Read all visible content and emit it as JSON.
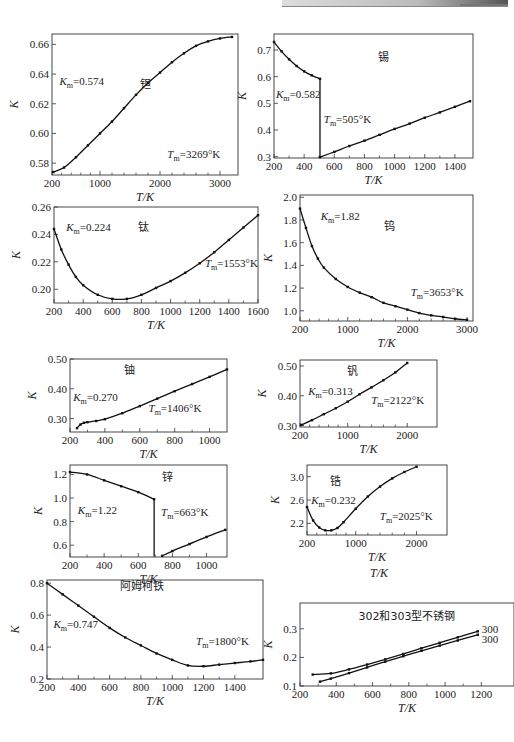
{
  "page": {
    "header_band": "running header (illegible)"
  },
  "chart_data": [
    {
      "id": "tantalum",
      "type": "line",
      "title": "钽",
      "xlabel": "T/K",
      "ylabel": "K",
      "xlim": [
        200,
        3300
      ],
      "ylim": [
        0.572,
        0.667
      ],
      "xticks": [
        200,
        1000,
        2000,
        3000
      ],
      "yticks": [
        0.58,
        0.6,
        0.62,
        0.64,
        0.66
      ],
      "ytick_labels": [
        "0.58",
        "0.60",
        "0.62",
        "0.64",
        "0.66"
      ],
      "annotations": {
        "km": "K",
        "km_sub": "m",
        "km_val": "=0.574",
        "tm": "T",
        "tm_sub": "m",
        "tm_val": "=3269°K"
      },
      "series": [
        {
          "name": "钽",
          "x": [
            220,
            400,
            600,
            800,
            1000,
            1200,
            1400,
            1600,
            1800,
            2000,
            2200,
            2400,
            2600,
            2800,
            3000,
            3200
          ],
          "y": [
            0.574,
            0.577,
            0.584,
            0.592,
            0.6,
            0.608,
            0.617,
            0.626,
            0.634,
            0.641,
            0.648,
            0.654,
            0.659,
            0.662,
            0.664,
            0.665
          ]
        }
      ]
    },
    {
      "id": "tin",
      "type": "line",
      "title": "锡",
      "xlabel": "T/K",
      "ylabel": "K",
      "xlim": [
        200,
        1520
      ],
      "ylim": [
        0.295,
        0.76
      ],
      "xticks": [
        200,
        400,
        600,
        800,
        1000,
        1200,
        1400
      ],
      "yticks": [
        0.3,
        0.4,
        0.5,
        0.6,
        0.7
      ],
      "ytick_labels": [
        "0.3",
        "0.4",
        "0.5",
        "0.6",
        "0.7"
      ],
      "annotations": {
        "km": "K",
        "km_sub": "m",
        "km_val": "=0.582",
        "tm": "T",
        "tm_sub": "m",
        "tm_val": "=505°K"
      },
      "series": [
        {
          "name": "solid",
          "x": [
            200,
            250,
            300,
            350,
            400,
            450,
            505
          ],
          "y": [
            0.73,
            0.695,
            0.665,
            0.64,
            0.62,
            0.605,
            0.592
          ]
        },
        {
          "name": "drop",
          "x": [
            505,
            505
          ],
          "y": [
            0.592,
            0.298
          ],
          "markers": false
        },
        {
          "name": "liquid",
          "x": [
            505,
            600,
            700,
            800,
            900,
            1000,
            1100,
            1200,
            1300,
            1400,
            1500
          ],
          "y": [
            0.298,
            0.318,
            0.34,
            0.36,
            0.382,
            0.404,
            0.424,
            0.446,
            0.466,
            0.487,
            0.508
          ]
        }
      ]
    },
    {
      "id": "titanium",
      "type": "line",
      "title": "钛",
      "xlabel": "T/K",
      "ylabel": "K",
      "xlim": [
        200,
        1600
      ],
      "ylim": [
        0.19,
        0.26
      ],
      "xticks": [
        200,
        400,
        600,
        800,
        1000,
        1200,
        1400,
        1600
      ],
      "yticks": [
        0.2,
        0.22,
        0.24,
        0.26
      ],
      "ytick_labels": [
        "0.20",
        "0.22",
        "0.24",
        "0.26"
      ],
      "annotations": {
        "km": "K",
        "km_sub": "m",
        "km_val": "=0.224",
        "tm": "T",
        "tm_sub": "m",
        "tm_val": "=1553°K"
      },
      "series": [
        {
          "name": "钛",
          "x": [
            200,
            250,
            300,
            350,
            400,
            500,
            600,
            700,
            800,
            900,
            1000,
            1100,
            1200,
            1300,
            1400,
            1500,
            1600
          ],
          "y": [
            0.244,
            0.229,
            0.218,
            0.209,
            0.203,
            0.196,
            0.193,
            0.193,
            0.196,
            0.201,
            0.206,
            0.212,
            0.219,
            0.227,
            0.236,
            0.245,
            0.254
          ]
        }
      ]
    },
    {
      "id": "tungsten",
      "type": "line",
      "title": "钨",
      "xlabel": "T/K",
      "ylabel": "K",
      "xlim": [
        200,
        3100
      ],
      "ylim": [
        0.91,
        2.02
      ],
      "xticks": [
        200,
        1000,
        2000,
        3000
      ],
      "yticks": [
        1.0,
        1.2,
        1.4,
        1.6,
        1.8,
        2.0
      ],
      "ytick_labels": [
        "1.0",
        "1.2",
        "1.4",
        "1.6",
        "1.8",
        "2.0"
      ],
      "annotations": {
        "km": "K",
        "km_sub": "m",
        "km_val": "=1.82",
        "tm": "T",
        "tm_sub": "m",
        "tm_val": "=3653°K"
      },
      "series": [
        {
          "name": "钨",
          "x": [
            200,
            300,
            400,
            500,
            600,
            800,
            1000,
            1200,
            1400,
            1600,
            1800,
            2000,
            2200,
            2400,
            2600,
            2800,
            3000
          ],
          "y": [
            1.9,
            1.73,
            1.57,
            1.46,
            1.38,
            1.28,
            1.21,
            1.16,
            1.12,
            1.07,
            1.04,
            1.01,
            0.98,
            0.96,
            0.945,
            0.93,
            0.92
          ]
        }
      ]
    },
    {
      "id": "uranium",
      "type": "line",
      "title": "铀",
      "xlabel": "T/K",
      "ylabel": "K",
      "xlim": [
        200,
        1100
      ],
      "ylim": [
        0.255,
        0.5
      ],
      "xticks": [
        200,
        400,
        600,
        800,
        1000
      ],
      "yticks": [
        0.3,
        0.4,
        0.5
      ],
      "ytick_labels": [
        "0.30",
        "0.40",
        "0.50"
      ],
      "annotations": {
        "km": "K",
        "km_sub": "m",
        "km_val": "=0.270",
        "tm": "T",
        "tm_sub": "m",
        "tm_val": "=1406°K"
      },
      "series": [
        {
          "name": "铀",
          "x": [
            240,
            260,
            280,
            300,
            350,
            400,
            500,
            600,
            700,
            800,
            900,
            1000,
            1100
          ],
          "y": [
            0.268,
            0.28,
            0.286,
            0.288,
            0.292,
            0.298,
            0.318,
            0.342,
            0.367,
            0.392,
            0.416,
            0.44,
            0.465
          ]
        }
      ]
    },
    {
      "id": "vanadium",
      "type": "line",
      "title": "钒",
      "xlabel": "T/K",
      "ylabel": "K",
      "xlim": [
        200,
        2500
      ],
      "ylim": [
        0.295,
        0.52
      ],
      "xticks": [
        200,
        1000,
        2000
      ],
      "yticks": [
        0.3,
        0.4,
        0.5
      ],
      "ytick_labels": [
        "0.30",
        "0.40",
        "0.50"
      ],
      "annotations": {
        "km": "K",
        "km_sub": "m",
        "km_val": "=0.313",
        "tm": "T",
        "tm_sub": "m",
        "tm_val": "=2122°K"
      },
      "series": [
        {
          "name": "钒",
          "x": [
            220,
            400,
            600,
            800,
            1000,
            1200,
            1400,
            1600,
            1800,
            2000
          ],
          "y": [
            0.302,
            0.318,
            0.338,
            0.358,
            0.38,
            0.405,
            0.428,
            0.452,
            0.478,
            0.51
          ]
        }
      ]
    },
    {
      "id": "zinc",
      "type": "line",
      "title": "锌",
      "xlabel": "T/K",
      "ylabel": "K",
      "xlim": [
        200,
        1120
      ],
      "ylim": [
        0.5,
        1.28
      ],
      "xticks": [
        200,
        400,
        600,
        800,
        1000
      ],
      "yticks": [
        0.6,
        0.8,
        1.0,
        1.2
      ],
      "ytick_labels": [
        "0.6",
        "0.8",
        "1.0",
        "1.2"
      ],
      "annotations": {
        "km": "K",
        "km_sub": "m",
        "km_val": "=1.22",
        "tm": "T",
        "tm_sub": "m",
        "tm_val": "=663°K"
      },
      "series": [
        {
          "name": "solid",
          "x": [
            200,
            300,
            400,
            500,
            600,
            693
          ],
          "y": [
            1.22,
            1.2,
            1.15,
            1.1,
            1.05,
            0.99
          ]
        },
        {
          "name": "drop",
          "x": [
            693,
            693
          ],
          "y": [
            0.99,
            0.505
          ],
          "markers": false
        },
        {
          "name": "liquid",
          "x": [
            740,
            800,
            900,
            1000,
            1110
          ],
          "y": [
            0.51,
            0.55,
            0.61,
            0.67,
            0.73
          ]
        }
      ]
    },
    {
      "id": "zirconium",
      "type": "line",
      "title": "锆",
      "xlabel": "T/K",
      "ylabel": "K",
      "xlim": [
        200,
        2500
      ],
      "ylim": [
        2.0,
        3.2
      ],
      "xticks": [
        200,
        1000,
        2000
      ],
      "yticks": [
        2.2,
        2.6,
        3.0
      ],
      "ytick_labels": [
        "2.2",
        "2.6",
        "3.0"
      ],
      "annotations": {
        "km": "K",
        "km_sub": "m",
        "km_val": "=0.232",
        "tm": "T",
        "tm_sub": "m",
        "tm_val": "=2025°K"
      },
      "series": [
        {
          "name": "锆",
          "x": [
            200,
            300,
            400,
            500,
            600,
            700,
            800,
            1000,
            1200,
            1400,
            1600,
            1800,
            2000
          ],
          "y": [
            2.48,
            2.25,
            2.13,
            2.08,
            2.08,
            2.12,
            2.22,
            2.45,
            2.66,
            2.83,
            2.97,
            3.08,
            3.17
          ]
        }
      ]
    },
    {
      "id": "armco-iron",
      "type": "line",
      "title": "阿姆柯铁",
      "xlabel": "T/K",
      "ylabel": "K",
      "xlim": [
        200,
        1580
      ],
      "ylim": [
        0.2,
        0.82
      ],
      "xticks": [
        200,
        400,
        600,
        800,
        1000,
        1200,
        1400
      ],
      "yticks": [
        0.2,
        0.4,
        0.6,
        0.8
      ],
      "ytick_labels": [
        "0.2",
        "0.4",
        "0.6",
        "0.8"
      ],
      "annotations": {
        "km": "K",
        "km_sub": "m",
        "km_val": "=0.747",
        "tm": "T",
        "tm_sub": "m",
        "tm_val": "=1800°K"
      },
      "series": [
        {
          "name": "阿姆柯铁",
          "x": [
            200,
            300,
            400,
            500,
            600,
            700,
            800,
            900,
            1000,
            1100,
            1200,
            1300,
            1400,
            1500,
            1580
          ],
          "y": [
            0.8,
            0.73,
            0.66,
            0.59,
            0.52,
            0.46,
            0.41,
            0.36,
            0.32,
            0.285,
            0.28,
            0.29,
            0.3,
            0.31,
            0.32
          ]
        }
      ]
    },
    {
      "id": "stainless-302-303",
      "type": "line",
      "title": "302和303型不锈钢",
      "xlabel": "T/K",
      "ylabel": "K",
      "xlim": [
        200,
        1380
      ],
      "ylim": [
        0.1,
        0.39
      ],
      "xticks": [
        200,
        400,
        600,
        800,
        1000,
        1200
      ],
      "yticks": [
        0.1,
        0.2,
        0.3
      ],
      "ytick_labels": [
        "0.1",
        "0.2",
        "0.3"
      ],
      "annotations": {
        "label_a": "300",
        "label_b": "300"
      },
      "series": [
        {
          "name": "300 (upper)",
          "x": [
            270,
            370,
            470,
            570,
            670,
            770,
            870,
            970,
            1070,
            1180
          ],
          "y": [
            0.14,
            0.144,
            0.158,
            0.175,
            0.193,
            0.212,
            0.232,
            0.251,
            0.27,
            0.291
          ]
        },
        {
          "name": "300 (lower)",
          "x": [
            310,
            370,
            470,
            570,
            670,
            770,
            870,
            970,
            1070,
            1180
          ],
          "y": [
            0.115,
            0.126,
            0.145,
            0.165,
            0.185,
            0.204,
            0.223,
            0.241,
            0.259,
            0.279
          ]
        }
      ]
    }
  ],
  "layout": [
    {
      "left": 52,
      "top": 34,
      "width": 186,
      "height": 141
    },
    {
      "left": 274,
      "top": 34,
      "width": 199,
      "height": 124
    },
    {
      "left": 54,
      "top": 207,
      "width": 204,
      "height": 96
    },
    {
      "left": 300,
      "top": 195,
      "width": 173,
      "height": 126
    },
    {
      "left": 70,
      "top": 359,
      "width": 157,
      "height": 73
    },
    {
      "left": 300,
      "top": 360,
      "width": 137,
      "height": 67
    },
    {
      "left": 70,
      "top": 465,
      "width": 157,
      "height": 92
    },
    {
      "left": 307,
      "top": 465,
      "width": 140,
      "height": 70
    },
    {
      "left": 47,
      "top": 580,
      "width": 216,
      "height": 99
    },
    {
      "left": 300,
      "top": 603,
      "width": 214,
      "height": 83
    }
  ],
  "standalone_axis_title": "T/K"
}
